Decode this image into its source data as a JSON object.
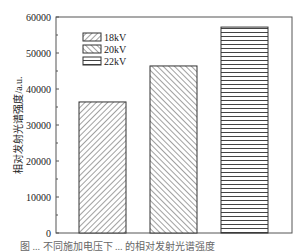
{
  "chart_data": {
    "type": "bar",
    "title": "",
    "xlabel": "",
    "ylabel": "相对发射光谱强度/a.u.",
    "ylim": [
      0,
      60000
    ],
    "yticks": [
      0,
      10000,
      20000,
      30000,
      40000,
      50000,
      60000
    ],
    "ytick_labels": [
      "0",
      "10000",
      "20000",
      "30000",
      "40000",
      "50000",
      "60000"
    ],
    "grid": false,
    "legend_position": "top-left",
    "categories": [
      "18kV",
      "20kV",
      "22kV"
    ],
    "series": [
      {
        "name": "18kV",
        "value": 36400,
        "pattern": "hatch-forward"
      },
      {
        "name": "20kV",
        "value": 46400,
        "pattern": "hatch-backward"
      },
      {
        "name": "22kV",
        "value": 57200,
        "pattern": "horizontal-lines"
      }
    ],
    "values": [
      36400,
      46400,
      57200
    ]
  },
  "caption": "图 ... 不同施加电压下 ... 的相对发射光谱强度"
}
